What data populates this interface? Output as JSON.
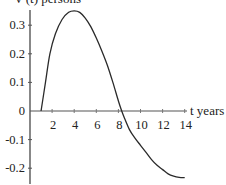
{
  "chart_data": {
    "type": "line",
    "title": "",
    "ylabel": "V'(t) persons",
    "xlabel": "t years",
    "xlim": [
      0,
      14
    ],
    "ylim": [
      -0.25,
      0.36
    ],
    "grid": false,
    "legend": null,
    "x_ticks": [
      2,
      4,
      6,
      8,
      10,
      12,
      14
    ],
    "x_tick_labels": [
      "2",
      "4",
      "6",
      "8",
      "10",
      "12",
      "14"
    ],
    "y_ticks": [
      -0.2,
      -0.1,
      0,
      0.1,
      0.2,
      0.3
    ],
    "y_tick_labels": [
      "-0.2",
      "-0.1",
      "0",
      "0.1",
      "0.2",
      "0.3"
    ],
    "series": [
      {
        "name": "V'(t)",
        "x": [
          1,
          1.4,
          1.8,
          2.3,
          2.9,
          3.5,
          4,
          4.5,
          5,
          5.5,
          6,
          6.5,
          7,
          7.5,
          8,
          8.3,
          8.5,
          9,
          9.5,
          10,
          10.5,
          11,
          11.5,
          12,
          12.5,
          13,
          13.5,
          14
        ],
        "values": [
          0,
          0.1,
          0.2,
          0.27,
          0.32,
          0.345,
          0.35,
          0.345,
          0.325,
          0.295,
          0.255,
          0.21,
          0.16,
          0.1,
          0.035,
          0,
          -0.02,
          -0.065,
          -0.095,
          -0.12,
          -0.145,
          -0.17,
          -0.19,
          -0.205,
          -0.22,
          -0.228,
          -0.232,
          -0.233
        ]
      }
    ]
  },
  "labels": {
    "y_axis_title": "V'(t) persons",
    "x_axis_title": "t years"
  }
}
